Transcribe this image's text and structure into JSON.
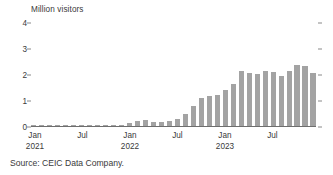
{
  "chart_data": {
    "type": "bar",
    "title": "",
    "ylabel": "Million visitors",
    "xlabel": "",
    "ylim": [
      0,
      4
    ],
    "ytick_labels": [
      "0",
      "1",
      "2",
      "3",
      "4"
    ],
    "ytick_values": [
      0,
      1,
      2,
      3,
      4
    ],
    "grid": false,
    "legend": null,
    "bar_color": "#a3a3a3",
    "axis_color": "#6e6e6e",
    "x_tick_labels": [
      {
        "label": "Jan",
        "year": "2021",
        "index": 0
      },
      {
        "label": "Jul",
        "year": "",
        "index": 6
      },
      {
        "label": "Jan",
        "year": "2022",
        "index": 12
      },
      {
        "label": "Jul",
        "year": "",
        "index": 18
      },
      {
        "label": "Jan",
        "year": "2023",
        "index": 24
      },
      {
        "label": "Jul",
        "year": "",
        "index": 30
      }
    ],
    "categories": [
      "Jan 2021",
      "Feb 2021",
      "Mar 2021",
      "Apr 2021",
      "May 2021",
      "Jun 2021",
      "Jul 2021",
      "Aug 2021",
      "Sep 2021",
      "Oct 2021",
      "Nov 2021",
      "Dec 2021",
      "Jan 2022",
      "Feb 2022",
      "Mar 2022",
      "Apr 2022",
      "May 2022",
      "Jun 2022",
      "Jul 2022",
      "Aug 2022",
      "Sep 2022",
      "Oct 2022",
      "Nov 2022",
      "Dec 2022",
      "Jan 2023",
      "Feb 2023",
      "Mar 2023",
      "Apr 2023",
      "May 2023",
      "Jun 2023",
      "Jul 2023",
      "Aug 2023",
      "Sep 2023",
      "Oct 2023",
      "Nov 2023",
      "Dec 2023"
    ],
    "values": [
      0.01,
      0.01,
      0.01,
      0.01,
      0.01,
      0.01,
      0.01,
      0.01,
      0.01,
      0.01,
      0.01,
      0.02,
      0.1,
      0.18,
      0.22,
      0.14,
      0.14,
      0.2,
      0.27,
      0.46,
      0.76,
      1.08,
      1.14,
      1.2,
      1.38,
      1.63,
      2.13,
      2.04,
      2.0,
      2.1,
      2.06,
      1.92,
      2.1,
      2.33,
      2.31,
      2.02
    ],
    "values_tail": [
      2.08,
      2.45,
      3.1
    ],
    "series_note": ""
  },
  "source": {
    "text": "Source: CEIC Data Company."
  }
}
